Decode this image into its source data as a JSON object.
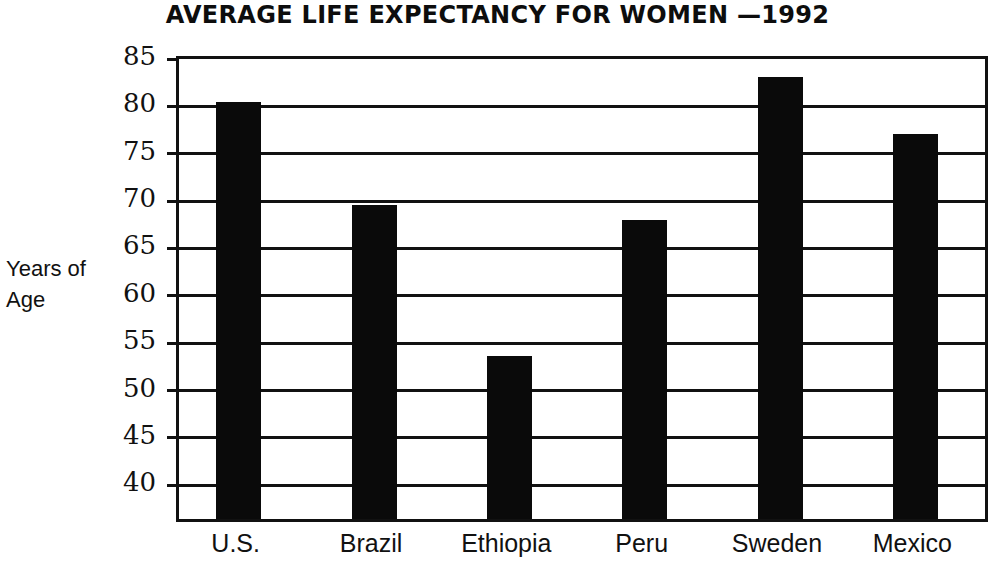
{
  "chart_data": {
    "type": "bar",
    "title": "AVERAGE LIFE EXPECTANCY FOR WOMEN —1992",
    "xlabel": "",
    "ylabel": "Years of Age",
    "ylabel_lines": [
      "Years of",
      "Age"
    ],
    "categories": [
      "U.S.",
      "Brazil",
      "Ethiopia",
      "Peru",
      "Sweden",
      "Mexico"
    ],
    "values": [
      79.8,
      69.0,
      53.0,
      67.4,
      82.5,
      76.4
    ],
    "ylim": [
      35.8,
      85
    ],
    "ytick_labels": [
      "85",
      "80",
      "75",
      "70",
      "65",
      "60",
      "55",
      "50",
      "45",
      "40"
    ],
    "yticks": [
      85,
      80,
      75,
      70,
      65,
      60,
      55,
      50,
      45,
      40
    ],
    "grid": true,
    "legend": null,
    "bar_color": "#0a0a0a",
    "axis_color": "#111111",
    "background": "#ffffff"
  }
}
